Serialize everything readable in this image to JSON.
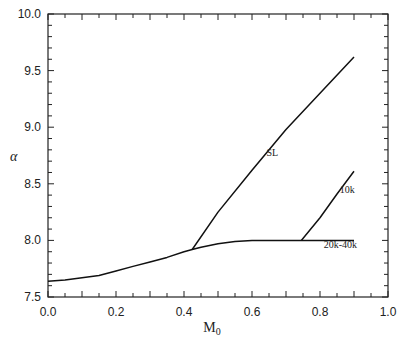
{
  "chart_data": {
    "type": "line",
    "title": "",
    "xlabel": "M0",
    "xlabel_main": "M",
    "xlabel_sub": "0",
    "ylabel": "α",
    "xlim": [
      0.0,
      1.0
    ],
    "ylim": [
      7.5,
      10.0
    ],
    "grid": false,
    "legend": "none (inline annotations)",
    "x_ticks": [
      "0.0",
      "0.2",
      "0.4",
      "0.6",
      "0.8",
      "1.0"
    ],
    "y_ticks": [
      "7.5",
      "8.0",
      "8.5",
      "9.0",
      "9.5",
      "10.0"
    ],
    "series": [
      {
        "name": "20k-40k",
        "x": [
          0.0,
          0.05,
          0.1,
          0.15,
          0.2,
          0.25,
          0.3,
          0.35,
          0.4,
          0.424,
          0.45,
          0.5,
          0.55,
          0.6,
          0.7,
          0.8,
          0.9
        ],
        "y": [
          7.64,
          7.65,
          7.67,
          7.69,
          7.73,
          7.77,
          7.81,
          7.85,
          7.9,
          7.92,
          7.94,
          7.97,
          7.99,
          8.0,
          8.0,
          8.0,
          8.0
        ]
      },
      {
        "name": "SL",
        "x": [
          0.424,
          0.5,
          0.6,
          0.7,
          0.8,
          0.9
        ],
        "y": [
          7.92,
          8.25,
          8.62,
          8.98,
          9.3,
          9.62
        ]
      },
      {
        "name": "10k",
        "x": [
          0.745,
          0.8,
          0.85,
          0.9
        ],
        "y": [
          8.0,
          8.2,
          8.41,
          8.61
        ]
      }
    ],
    "annotations": [
      {
        "text": "SL",
        "x": 0.66,
        "y": 8.75
      },
      {
        "text": "10k",
        "x": 0.88,
        "y": 8.42
      },
      {
        "text": "20k-40k",
        "x": 0.86,
        "y": 7.93
      }
    ]
  }
}
